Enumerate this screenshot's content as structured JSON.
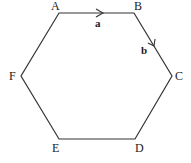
{
  "diagram": {
    "type": "regular-hexagon",
    "vertices": [
      {
        "label": "A",
        "x": 59,
        "y": 13,
        "lx": 55,
        "ly": 9
      },
      {
        "label": "B",
        "x": 134,
        "y": 13,
        "lx": 138,
        "ly": 9
      },
      {
        "label": "C",
        "x": 172,
        "y": 76,
        "lx": 179,
        "ly": 80
      },
      {
        "label": "D",
        "x": 135,
        "y": 139,
        "lx": 139,
        "ly": 151
      },
      {
        "label": "E",
        "x": 59,
        "y": 139,
        "lx": 56,
        "ly": 151
      },
      {
        "label": "F",
        "x": 21,
        "y": 76,
        "lx": 13,
        "ly": 80
      }
    ],
    "vectors": [
      {
        "label": "a",
        "from": "A",
        "to": "B",
        "lx": 98,
        "ly": 26
      },
      {
        "label": "b",
        "from": "B",
        "to": "C",
        "lx": 144,
        "ly": 54
      }
    ],
    "colors": {
      "stroke": "#333333",
      "background": "#ffffff"
    }
  }
}
